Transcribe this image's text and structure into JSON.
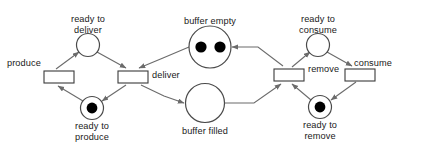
{
  "diagram": {
    "type": "petri-net",
    "canvas": {
      "width": 421,
      "height": 150
    },
    "colors": {
      "background": "#ffffff",
      "edge": "#6b6b6b",
      "place_stroke": "#4a4a4a",
      "transition_stroke": "#3a3a3a",
      "token": "#000000",
      "text": "#1a1a1a"
    },
    "places": [
      {
        "id": "ready_to_deliver",
        "label": "ready to\ndeliver",
        "tokens": 0,
        "cx": 88,
        "cy": 45,
        "r": 11.5,
        "label_x": 88,
        "label_y": 14
      },
      {
        "id": "ready_to_produce",
        "label": "ready to\nproduce",
        "tokens": 1,
        "cx": 92,
        "cy": 108,
        "r": 11.5,
        "label_x": 92,
        "label_y": 121
      },
      {
        "id": "buffer_empty",
        "label": "buffer empty",
        "tokens": 2,
        "cx": 210,
        "cy": 47,
        "r": 21,
        "label_x": 210,
        "label_y": 16
      },
      {
        "id": "buffer_filled",
        "label": "buffer filled",
        "tokens": 0,
        "cx": 205,
        "cy": 103,
        "r": 19.5,
        "label_x": 205,
        "label_y": 126
      },
      {
        "id": "ready_to_consume",
        "label": "ready to\nconsume",
        "tokens": 0,
        "cx": 318,
        "cy": 45,
        "r": 11.5,
        "label_x": 318,
        "label_y": 14
      },
      {
        "id": "ready_to_remove",
        "label": "ready to\nremove",
        "tokens": 1,
        "cx": 320,
        "cy": 107,
        "r": 11.5,
        "label_x": 320,
        "label_y": 120
      }
    ],
    "transitions": [
      {
        "id": "produce",
        "label": "produce",
        "x": 44,
        "y": 71,
        "w": 30,
        "h": 12,
        "label_x": 7,
        "label_y": 58
      },
      {
        "id": "deliver",
        "label": "deliver",
        "x": 118,
        "y": 71,
        "w": 30,
        "h": 12,
        "label_x": 152,
        "label_y": 70
      },
      {
        "id": "remove",
        "label": "remove",
        "x": 274,
        "y": 69,
        "w": 30,
        "h": 12,
        "label_x": 308,
        "label_y": 64
      },
      {
        "id": "consume",
        "label": "consume",
        "x": 345,
        "y": 69,
        "w": 30,
        "h": 12,
        "label_x": 354,
        "label_y": 58
      }
    ],
    "arcs": [
      {
        "from": "produce",
        "to": "ready_to_deliver"
      },
      {
        "from": "ready_to_deliver",
        "to": "deliver"
      },
      {
        "from": "deliver",
        "to": "ready_to_produce"
      },
      {
        "from": "ready_to_produce",
        "to": "produce"
      },
      {
        "from": "deliver",
        "to": "buffer_filled"
      },
      {
        "from": "buffer_empty",
        "to": "deliver"
      },
      {
        "from": "buffer_filled",
        "to": "remove"
      },
      {
        "from": "remove",
        "to": "buffer_empty"
      },
      {
        "from": "remove",
        "to": "ready_to_consume"
      },
      {
        "from": "ready_to_consume",
        "to": "consume"
      },
      {
        "from": "consume",
        "to": "ready_to_remove"
      },
      {
        "from": "ready_to_remove",
        "to": "remove"
      }
    ]
  }
}
